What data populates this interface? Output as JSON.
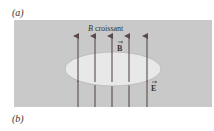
{
  "labels": {
    "part_a": "(a)",
    "part_b": "(b)"
  },
  "figure": {
    "title_var": "B",
    "title_text": "croissant",
    "vector_b": "B",
    "vector_e": "E",
    "colors": {
      "panel": "#c9c9c9",
      "arrow": "#5a4a4a",
      "ellipse_fill": "#e6e6e6",
      "ellipse_stroke": "#b0b0b0"
    },
    "arrow_x": [
      78,
      95,
      112,
      129,
      147
    ]
  }
}
